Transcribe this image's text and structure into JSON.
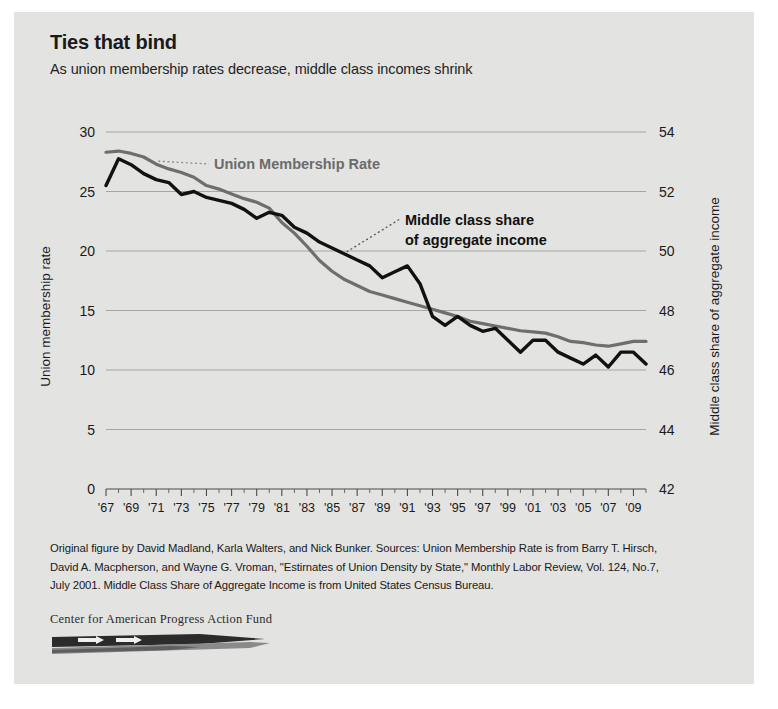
{
  "header": {
    "title": "Ties that bind",
    "subtitle": "As union membership rates decrease, middle class incomes shrink"
  },
  "footer": {
    "note_line1": "Original figure by David Madland, Karla Walters, and Nick Bunker. Sources: Union Membership Rate is from Barry T. Hirsch,",
    "note_line2": "David A. Macpherson, and Wayne G. Vroman, \"Estirnates of Union Density by State,\" Monthly Labor Review, Vol. 124, No.7,",
    "note_line3": "July 2001. Middle Class Share of Aggregate Income is from United States Census Bureau.",
    "logo_text": "Center for American Progress Action Fund"
  },
  "colors": {
    "background": "#e3e3e1",
    "union_line": "#6e6e6e",
    "middle_class_line": "#111111",
    "gridline": "#9a9a9a",
    "text": "#1a1a1a"
  },
  "chart_data": {
    "type": "line",
    "title": "Ties that bind",
    "subtitle": "As union membership rates decrease, middle class incomes shrink",
    "xlabel": "",
    "ylabel": "Union membership rate",
    "y2label": "Middle class share of aggregate income",
    "ylim": [
      0,
      30
    ],
    "y2lim": [
      42,
      54
    ],
    "yticks": [
      "0",
      "5",
      "10",
      "15",
      "20",
      "25",
      "30"
    ],
    "y2ticks": [
      "42",
      "44",
      "46",
      "48",
      "50",
      "52",
      "54"
    ],
    "grid": true,
    "legend_position": "inline-annotations",
    "x": [
      1967,
      1968,
      1969,
      1970,
      1971,
      1972,
      1973,
      1974,
      1975,
      1976,
      1977,
      1978,
      1979,
      1980,
      1981,
      1982,
      1983,
      1984,
      1985,
      1986,
      1987,
      1988,
      1989,
      1990,
      1991,
      1992,
      1993,
      1994,
      1995,
      1996,
      1997,
      1998,
      1999,
      2000,
      2001,
      2002,
      2003,
      2004,
      2005,
      2006,
      2007,
      2008,
      2009,
      2010
    ],
    "xtick_labels": [
      "'67",
      "'69",
      "'71",
      "'73",
      "'75",
      "'77",
      "'79",
      "'81",
      "'83",
      "'85",
      "'87",
      "'89",
      "'91",
      "'93",
      "'95",
      "'97",
      "'99",
      "'01",
      "'03",
      "'05",
      "'07",
      "'09"
    ],
    "series": [
      {
        "name": "Union Membership Rate",
        "axis": "left",
        "color": "#6e6e6e",
        "label_text": "Union Membership Rate",
        "values": [
          28.3,
          28.4,
          28.2,
          27.9,
          27.3,
          26.9,
          26.6,
          26.2,
          25.5,
          25.2,
          24.8,
          24.4,
          24.1,
          23.6,
          22.4,
          21.5,
          20.4,
          19.2,
          18.3,
          17.6,
          17.1,
          16.6,
          16.3,
          16.0,
          15.7,
          15.4,
          15.1,
          14.8,
          14.5,
          14.1,
          13.9,
          13.7,
          13.5,
          13.3,
          13.2,
          13.1,
          12.8,
          12.4,
          12.3,
          12.1,
          12.0,
          12.2,
          12.4,
          12.4
        ]
      },
      {
        "name": "Middle class share of aggregate income",
        "axis": "right",
        "color": "#111111",
        "label_line1": "Middle class share",
        "label_line2": "of aggregate income",
        "values": [
          52.2,
          53.1,
          52.9,
          52.6,
          52.4,
          52.3,
          51.9,
          52.0,
          51.8,
          51.7,
          51.6,
          51.4,
          51.1,
          51.3,
          51.2,
          50.8,
          50.6,
          50.3,
          50.1,
          49.9,
          49.7,
          49.5,
          49.1,
          49.3,
          49.5,
          48.9,
          47.8,
          47.5,
          47.8,
          47.5,
          47.3,
          47.4,
          47.0,
          46.6,
          47.0,
          47.0,
          46.6,
          46.4,
          46.2,
          46.5,
          46.1,
          46.6,
          46.6,
          46.2
        ]
      }
    ],
    "annotations": [
      {
        "text": "Union Membership Rate",
        "target_year": 1971,
        "style": "gray-bold"
      },
      {
        "text": "Middle class share of aggregate income",
        "target_year": 1986,
        "style": "black-bold"
      }
    ]
  }
}
